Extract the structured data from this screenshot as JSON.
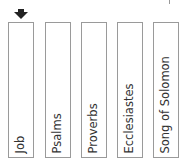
{
  "marker": {
    "icon": "arrow-down-icon",
    "position_index": 0
  },
  "books": [
    {
      "label": "Job"
    },
    {
      "label": "Psalms"
    },
    {
      "label": "Proverbs"
    },
    {
      "label": "Ecclesiastes"
    },
    {
      "label": "Song of Solomon"
    }
  ]
}
